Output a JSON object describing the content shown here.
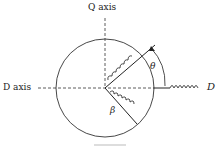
{
  "labels": {
    "q_axis": "Q axis",
    "d_axis": "D axis",
    "d_right": "D",
    "theta": "θ",
    "beta": "β"
  },
  "colors": {
    "ink": "#222222",
    "background": "#ffffff"
  }
}
